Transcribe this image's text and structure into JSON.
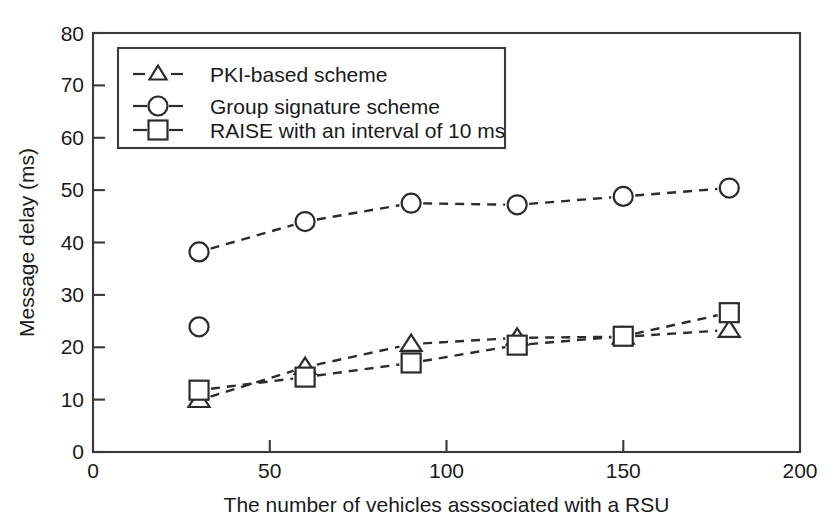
{
  "chart_data": {
    "type": "line",
    "title": "",
    "xlabel": "The number of vehicles asssociated with a RSU",
    "ylabel": "Message delay (ms)",
    "xlim": [
      0,
      200
    ],
    "ylim": [
      0,
      80
    ],
    "xticks": [
      0,
      50,
      100,
      150,
      200
    ],
    "yticks": [
      0,
      10,
      20,
      30,
      40,
      50,
      60,
      70,
      80
    ],
    "xtick_labels": [
      "0",
      "50",
      "100",
      "150",
      "200"
    ],
    "ytick_labels": [
      "0",
      "10",
      "20",
      "30",
      "40",
      "50",
      "60",
      "70",
      "80"
    ],
    "grid": false,
    "legend_position": "upper left",
    "x": [
      30,
      60,
      90,
      120,
      150,
      180
    ],
    "series": [
      {
        "name": "PKI-based scheme",
        "marker": "triangle",
        "linestyle": "dashed",
        "color": "#2b2b2b",
        "values": [
          9.9,
          16.2,
          20.6,
          21.8,
          22.0,
          23.3
        ]
      },
      {
        "name": "Group signature scheme",
        "marker": "circle",
        "linestyle": "dashed",
        "color": "#2b2b2b",
        "values": [
          38.2,
          44.0,
          47.5,
          47.2,
          48.8,
          50.4
        ]
      },
      {
        "name": "RAISE with an interval of 10 ms",
        "marker": "square",
        "linestyle": "dashed",
        "color": "#2b2b2b",
        "values": [
          11.8,
          14.3,
          17.0,
          20.4,
          22.1,
          26.6
        ]
      }
    ],
    "extra_points": [
      {
        "note": "unconnected circle marker",
        "marker": "circle",
        "x": 30,
        "y": 23.9
      }
    ]
  },
  "axes": {
    "y_title": "Message delay (ms)",
    "x_title": "The number of vehicles asssociated with a RSU",
    "x_tick_0": "0",
    "x_tick_1": "50",
    "x_tick_2": "100",
    "x_tick_3": "150",
    "x_tick_4": "200",
    "y_tick_0": "0",
    "y_tick_1": "10",
    "y_tick_2": "20",
    "y_tick_3": "30",
    "y_tick_4": "40",
    "y_tick_5": "50",
    "y_tick_6": "60",
    "y_tick_7": "70",
    "y_tick_8": "80"
  },
  "legend": {
    "entry_0": "PKI-based scheme",
    "entry_1": "Group signature scheme",
    "entry_2": "RAISE with an interval of 10 ms"
  },
  "colors": {
    "ink": "#2b2b2b",
    "frame": "#3a3a3a",
    "background": "#ffffff",
    "marker_fill": "#ffffff"
  }
}
